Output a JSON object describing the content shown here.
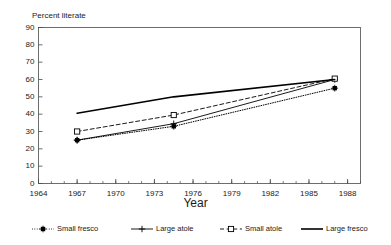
{
  "chart_data": {
    "type": "line",
    "title": "Percent literate",
    "xlabel": "Year",
    "ylabel": "Percent literate",
    "xlim": [
      1964,
      1989
    ],
    "ylim": [
      0,
      90
    ],
    "ytick_values": [
      0,
      10,
      20,
      30,
      40,
      50,
      60,
      70,
      80,
      90
    ],
    "ytick_labels": [
      "0",
      "10",
      "20",
      "30",
      "40",
      "50",
      "60",
      "70",
      "80",
      "90"
    ],
    "xtick_values": [
      1964,
      1967,
      1970,
      1973,
      1976,
      1979,
      1982,
      1985,
      1988
    ],
    "xtick_labels": [
      "1964",
      "1967",
      "1970",
      "1973",
      "1976",
      "1979",
      "1982",
      "1985",
      "1988"
    ],
    "xminor_step": 1,
    "grid": false,
    "legend_position": "bottom",
    "series": [
      {
        "name": "Small fresco",
        "line_style": "dotted",
        "marker": "asterisk",
        "color": "#000000",
        "x": [
          1967,
          1974.5,
          1987
        ],
        "values": [
          25,
          33,
          55
        ]
      },
      {
        "name": "Large atole",
        "line_style": "solid",
        "marker": "plus",
        "color": "#000000",
        "x": [
          1967,
          1974.5,
          1987
        ],
        "values": [
          25,
          34.5,
          60
        ]
      },
      {
        "name": "Small atole",
        "line_style": "dashed",
        "marker": "square",
        "color": "#000000",
        "x": [
          1967,
          1974.5,
          1987
        ],
        "values": [
          30,
          39.5,
          60.5
        ]
      },
      {
        "name": "Large fresco",
        "line_style": "solid-thick",
        "marker": "none",
        "color": "#000000",
        "x": [
          1967,
          1974.5,
          1987
        ],
        "values": [
          40.5,
          50,
          60
        ]
      }
    ]
  },
  "legend": {
    "entries": [
      {
        "label": "Small fresco",
        "icon": "dotted-line-asterisk-marker-icon"
      },
      {
        "label": "Large atole",
        "icon": "solid-line-plus-marker-icon"
      },
      {
        "label": "Small atole",
        "icon": "dashed-line-square-marker-icon"
      },
      {
        "label": "Large fresco",
        "icon": "solid-thick-line-icon"
      }
    ]
  }
}
